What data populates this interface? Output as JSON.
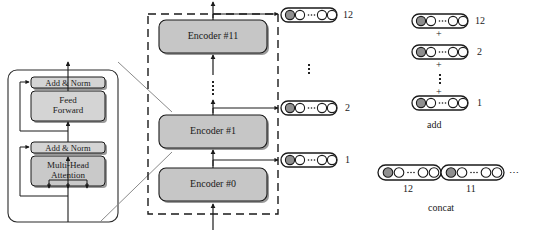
{
  "diagram": {
    "encoder_detail": {
      "name": "encoder-internal-detail",
      "blocks": [
        {
          "id": "add-norm-top",
          "label": "Add & Norm",
          "shade": "#d4d4d4"
        },
        {
          "id": "feed-forward",
          "label": "Feed\nForward",
          "line1": "Feed",
          "line2": "Forward",
          "shade": "#d4d4d4"
        },
        {
          "id": "add-norm-bottom",
          "label": "Add & Norm",
          "shade": "#d4d4d4"
        },
        {
          "id": "multi-head-attention",
          "label": "Multi-Head\nAttention",
          "line1": "Multi-Head",
          "line2": "Attention",
          "shade": "#c9c9c9"
        }
      ]
    },
    "stack": {
      "name": "encoder-stack",
      "border_style": "dashed",
      "encoders": [
        {
          "id": "encoder-11",
          "label": "Encoder #11"
        },
        {
          "id": "encoder-ellipsis",
          "label": "⋮"
        },
        {
          "id": "encoder-1",
          "label": "Encoder #1"
        },
        {
          "id": "encoder-0",
          "label": "Encoder #0"
        }
      ]
    },
    "hidden_outputs": {
      "name": "hidden-state-vectors",
      "items": [
        {
          "id": "hidden-12",
          "layer_number": "12"
        },
        {
          "id": "hidden-ellipsis",
          "layer_number": "⋮"
        },
        {
          "id": "hidden-2",
          "layer_number": "2"
        },
        {
          "id": "hidden-1",
          "layer_number": "1"
        }
      ]
    },
    "add_panel": {
      "name": "add-strategy",
      "caption": "add",
      "plus": "+",
      "rows": [
        {
          "id": "add-row-12",
          "layer_number": "12"
        },
        {
          "id": "add-row-2",
          "layer_number": "2"
        },
        {
          "id": "add-row-1",
          "layer_number": "1"
        }
      ]
    },
    "concat_panel": {
      "name": "concat-strategy",
      "caption": "concat",
      "trailing_ellipsis": "⋯",
      "segments": [
        {
          "id": "concat-seg-12",
          "layer_number": "12"
        },
        {
          "id": "concat-seg-11",
          "layer_number": "11"
        }
      ]
    },
    "vector_pill": {
      "name": "token-vector-pill",
      "inner_ellipsis": "⋯",
      "circles": [
        "filled",
        "empty",
        "ellipsis",
        "empty",
        "empty"
      ]
    },
    "colors": {
      "encoder_fill": "#c6c6c6",
      "block_fill": "#d4d4d4",
      "attention_fill": "#c9c9c9",
      "filled_circle": "#8f8f8f",
      "stroke": "#1a1a1a",
      "shadow": "#9a9a9a",
      "background": "#ffffff"
    }
  }
}
